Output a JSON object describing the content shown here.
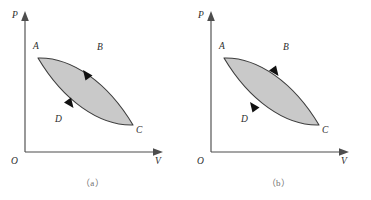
{
  "figure": {
    "kind": "pressure-volume-cycle-diagram",
    "background_color": "#ffffff",
    "fill_color": "#c9c9c9",
    "curve_color": "#3c3c3c",
    "axis_color": "#4d4d4d",
    "arrow_color": "#111111"
  },
  "panels": [
    {
      "id": "a",
      "caption": "（a）",
      "axes": {
        "y_label": "P",
        "x_label": "V",
        "origin_label": "O"
      },
      "cycle": {
        "direction": "clockwise",
        "points": [
          {
            "name": "A",
            "label": "A",
            "position": "upper-left"
          },
          {
            "name": "B",
            "label": "B",
            "position": "upper-right"
          },
          {
            "name": "C",
            "label": "C",
            "position": "lower-right"
          },
          {
            "name": "D",
            "label": "D",
            "position": "lower-left"
          }
        ],
        "arrows": [
          {
            "on_curve": "upper",
            "points_toward": "C"
          },
          {
            "on_curve": "lower",
            "points_toward": "A"
          }
        ]
      }
    },
    {
      "id": "b",
      "caption": "（b）",
      "axes": {
        "y_label": "P",
        "x_label": "V",
        "origin_label": "O"
      },
      "cycle": {
        "direction": "counterclockwise",
        "points": [
          {
            "name": "A",
            "label": "A",
            "position": "upper-left"
          },
          {
            "name": "B",
            "label": "B",
            "position": "upper-right"
          },
          {
            "name": "C",
            "label": "C",
            "position": "lower-right"
          },
          {
            "name": "D",
            "label": "D",
            "position": "lower-left"
          }
        ],
        "arrows": [
          {
            "on_curve": "upper",
            "points_toward": "A"
          },
          {
            "on_curve": "lower",
            "points_toward": "C"
          }
        ]
      }
    }
  ]
}
